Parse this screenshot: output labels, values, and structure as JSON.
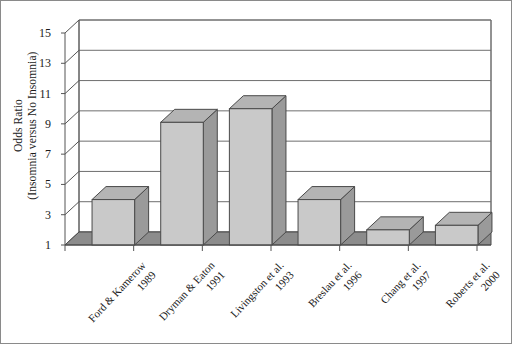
{
  "chart_data": {
    "type": "bar",
    "title": "",
    "xlabel": "",
    "ylabel": "Odds Ratio",
    "ylabel_line2": "(Insomnia versus No Insomnia)",
    "categories": [
      "Ford & Kamerow 1989",
      "Dryman & Eaton 1991",
      "Livingston et al. 1993",
      "Breslau et al. 1996",
      "Chang et al. 1997",
      "Roberts et al. 2000"
    ],
    "category_lines": [
      [
        "Ford & Kamerow",
        "1989"
      ],
      [
        "Dryman & Eaton",
        "1991"
      ],
      [
        "Livingston et al.",
        "1993"
      ],
      [
        "Breslau et al.",
        "1996"
      ],
      [
        "Chang et al.",
        "1997"
      ],
      [
        "Roberts et al.",
        "2000"
      ]
    ],
    "values": [
      4.0,
      9.1,
      10.0,
      4.0,
      2.0,
      2.3
    ],
    "ylim": [
      1,
      15
    ],
    "yticks": [
      15,
      13,
      11,
      9,
      7,
      5,
      3,
      1
    ],
    "ytick_labels": [
      "15",
      "13",
      "11",
      "9",
      "7",
      "5",
      "3",
      "1"
    ],
    "grid": true,
    "legend": "none",
    "style": "3d-column",
    "colors": {
      "bar_front": "#c9c9c9",
      "bar_side": "#9a9a9a",
      "bar_top": "#b4b4b4",
      "bar_edge": "#4a4a4a",
      "floor": "#8c8c8c",
      "gridline": "#6e6e6e",
      "axis": "#555555",
      "background": "#ffffff",
      "border": "#8a8a8a"
    }
  }
}
